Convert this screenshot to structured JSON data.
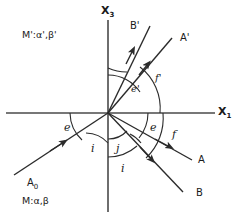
{
  "figure": {
    "background_color": "#ffffff",
    "line_color": "#2b2b2b",
    "text_color": "#1a1a1a"
  },
  "axes": {
    "vertical": {
      "label": "X",
      "subscript": "3",
      "x": 108,
      "top": 20,
      "bottom": 212
    },
    "horizontal": {
      "label": "X",
      "subscript": "1",
      "y": 113,
      "left": 6,
      "right": 215
    }
  },
  "origin": {
    "x": 108,
    "y": 113
  },
  "media": [
    {
      "name": "media-upper",
      "label": "M':α',β'",
      "x": 22,
      "y": 30
    },
    {
      "name": "media-lower",
      "label": "M:α,β",
      "x": 22,
      "y": 196
    }
  ],
  "rays": [
    {
      "name": "ray-A0-incident",
      "label": "A",
      "subscript": "0",
      "label_x": 27,
      "label_y": 178,
      "direction": "incoming",
      "x1": 14,
      "y1": 175,
      "x2": 108,
      "y2": 113,
      "arrow_t": 0.52
    },
    {
      "name": "ray-B-prime-reflected",
      "label": "B'",
      "subscript": "",
      "label_x": 130,
      "label_y": 21,
      "direction": "outgoing",
      "x1": 108,
      "y1": 113,
      "x2": 150,
      "y2": 26,
      "arrow_t": 0.68
    },
    {
      "name": "ray-A-prime-reflected",
      "label": "A'",
      "subscript": "",
      "label_x": 180,
      "label_y": 33,
      "direction": "outgoing",
      "x1": 108,
      "y1": 113,
      "x2": 172,
      "y2": 38,
      "arrow_t": 0.62
    },
    {
      "name": "ray-A-refracted",
      "label": "A",
      "subscript": "",
      "label_x": 198,
      "label_y": 155,
      "direction": "outgoing",
      "x1": 108,
      "y1": 113,
      "x2": 192,
      "y2": 160,
      "arrow_t": 0.7
    },
    {
      "name": "ray-B-refracted",
      "label": "B",
      "subscript": "",
      "label_x": 196,
      "label_y": 188,
      "direction": "outgoing",
      "x1": 108,
      "y1": 113,
      "x2": 183,
      "y2": 192,
      "arrow_t": 0.58
    }
  ],
  "angles": [
    {
      "name": "angle-e-prime",
      "label": "e'",
      "x": 131,
      "y": 84,
      "radius": 38
    },
    {
      "name": "angle-f-prime",
      "label": "f'",
      "x": 155,
      "y": 73,
      "radius": 52
    },
    {
      "name": "angle-e-lower-right",
      "label": "e",
      "x": 150,
      "y": 122,
      "radius": 40
    },
    {
      "name": "angle-f-lower-right",
      "label": "f",
      "x": 172,
      "y": 129,
      "radius": 55
    },
    {
      "name": "angle-e-left",
      "label": "e",
      "x": 64,
      "y": 122,
      "radius": 38
    },
    {
      "name": "angle-i-left",
      "label": "i",
      "x": 91,
      "y": 143,
      "radius": 30
    },
    {
      "name": "angle-j-lower",
      "label": "j",
      "x": 116,
      "y": 143,
      "radius": 26
    },
    {
      "name": "angle-i-lower",
      "label": "i",
      "x": 121,
      "y": 163,
      "radius": 44
    }
  ]
}
